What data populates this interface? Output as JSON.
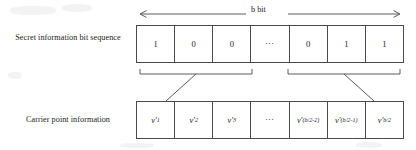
{
  "figure": {
    "span_label": "b bit"
  },
  "rows": {
    "secret": {
      "label": "Secret information bit sequence",
      "cells": [
        {
          "type": "bit",
          "text": "1"
        },
        {
          "type": "bit",
          "text": "0"
        },
        {
          "type": "bit",
          "text": "0"
        },
        {
          "type": "ellipsis",
          "text": "⋯"
        },
        {
          "type": "bit",
          "text": "0"
        },
        {
          "type": "bit",
          "text": "1"
        },
        {
          "type": "bit",
          "text": "1"
        }
      ]
    },
    "carrier": {
      "label": "Carrier point information",
      "cells": [
        {
          "type": "symbol",
          "base": "v′",
          "sub": "1",
          "text": "v′1"
        },
        {
          "type": "symbol",
          "base": "v′",
          "sub": "2",
          "text": "v′2"
        },
        {
          "type": "symbol",
          "base": "v′",
          "sub": "3",
          "text": "v′3"
        },
        {
          "type": "ellipsis",
          "base": "",
          "sub": "",
          "text": "⋯"
        },
        {
          "type": "symbol",
          "base": "v′",
          "sub": "(b/2-2)",
          "text": "v′(b/2-2)"
        },
        {
          "type": "symbol",
          "base": "v′",
          "sub": "(b/2-1)",
          "text": "v′(b/2-1)"
        },
        {
          "type": "symbol",
          "base": "v′",
          "sub": "b/2",
          "text": "v′b/2"
        }
      ]
    }
  },
  "annotations": {
    "measure_arrow": "double-headed-horizontal-arrow",
    "group_brackets": [
      {
        "name": "left-group-bracket",
        "spans_cells": "1-3"
      },
      {
        "name": "right-group-bracket",
        "spans_cells": "5-7"
      }
    ],
    "connector_lines": [
      {
        "name": "left-group-connector"
      },
      {
        "name": "right-group-connector"
      }
    ]
  },
  "colors": {
    "line": "#4a4a4a",
    "text": "#1c1c1c",
    "background": "#ffffff"
  }
}
